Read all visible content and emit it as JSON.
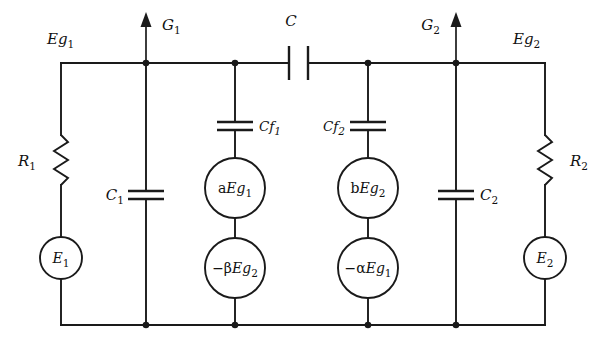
{
  "figure": {
    "name": "two-stage-coupled-amplifier-equivalent-circuit",
    "kind": "electrical-schematic",
    "background_color": "#ffffff",
    "line_color": "#1a1a1a",
    "width": 602,
    "height": 344
  },
  "labels": {
    "eg1": "Eg",
    "eg1_sub": "1",
    "eg2": "Eg",
    "eg2_sub": "2",
    "g1": "G",
    "g1_sub": "1",
    "g2": "G",
    "g2_sub": "2",
    "c_coupling": "C",
    "r1": "R",
    "r1_sub": "1",
    "r2": "R",
    "r2_sub": "2",
    "c1": "C",
    "c1_sub": "1",
    "c2": "C",
    "c2_sub": "2",
    "cf1": "Cf",
    "cf1_sub": "1",
    "cf2": "Cf",
    "cf2_sub": "2",
    "e1": "E",
    "e1_sub": "1",
    "e2": "E",
    "e2_sub": "2",
    "src_aeg1_prefix": "a",
    "src_aeg1_main": "Eg",
    "src_aeg1_sub": "1",
    "src_beg2_prefix": "b",
    "src_beg2_main": "Eg",
    "src_beg2_sub": "2",
    "src_mbeg2_prefix": "−β",
    "src_mbeg2_main": "Eg",
    "src_mbeg2_sub": "2",
    "src_maeg1_prefix": "−α",
    "src_maeg1_main": "Eg",
    "src_maeg1_sub": "1"
  },
  "components": [
    {
      "id": "R1",
      "type": "resistor",
      "label": "R1",
      "branch": "left-input",
      "between": [
        "top-rail-left-corner",
        "E1-top"
      ]
    },
    {
      "id": "E1",
      "type": "voltage-source",
      "label": "E1",
      "branch": "left-input",
      "between": [
        "R1-bottom",
        "bottom-rail"
      ]
    },
    {
      "id": "C1",
      "type": "capacitor",
      "label": "C1",
      "branch": "G1-node",
      "between": [
        "top-rail-node-G1",
        "bottom-rail"
      ]
    },
    {
      "id": "Cf1",
      "type": "capacitor",
      "label": "Cf1",
      "branch": "left-feedback",
      "between": [
        "top-rail-node-Cf1",
        "aEg1-top"
      ]
    },
    {
      "id": "aEg1",
      "type": "dependent-source",
      "label": "aEg1",
      "branch": "left-feedback",
      "between": [
        "Cf1-bottom",
        "-bEg2-top"
      ]
    },
    {
      "id": "-betaEg2",
      "type": "dependent-source",
      "label": "-βEg2",
      "branch": "left-feedback",
      "between": [
        "aEg1-bottom",
        "bottom-rail"
      ]
    },
    {
      "id": "C",
      "type": "capacitor",
      "label": "C",
      "branch": "top-rail-coupling",
      "between": [
        "top-rail-node-Cf1",
        "top-rail-node-Cf2"
      ]
    },
    {
      "id": "Cf2",
      "type": "capacitor",
      "label": "Cf2",
      "branch": "right-feedback",
      "between": [
        "top-rail-node-Cf2",
        "bEg2-top"
      ]
    },
    {
      "id": "bEg2",
      "type": "dependent-source",
      "label": "bEg2",
      "branch": "right-feedback",
      "between": [
        "Cf2-bottom",
        "-aEg1-top"
      ]
    },
    {
      "id": "-alphaEg1",
      "type": "dependent-source",
      "label": "-αEg1",
      "branch": "right-feedback",
      "between": [
        "bEg2-bottom",
        "bottom-rail"
      ]
    },
    {
      "id": "C2",
      "type": "capacitor",
      "label": "C2",
      "branch": "G2-node",
      "between": [
        "top-rail-node-G2",
        "bottom-rail"
      ]
    },
    {
      "id": "R2",
      "type": "resistor",
      "label": "R2",
      "branch": "right-output",
      "between": [
        "top-rail-right-corner",
        "E2-top"
      ]
    },
    {
      "id": "E2",
      "type": "voltage-source",
      "label": "E2",
      "branch": "right-output",
      "between": [
        "R2-bottom",
        "bottom-rail"
      ]
    }
  ],
  "nodes": [
    {
      "id": "G1",
      "label": "G1",
      "arrow": "up",
      "x": 146,
      "y": 63
    },
    {
      "id": "Cf1-tap",
      "x": 235,
      "y": 63
    },
    {
      "id": "Cf2-tap",
      "x": 368,
      "y": 63
    },
    {
      "id": "G2",
      "label": "G2",
      "arrow": "up",
      "x": 456,
      "y": 63
    }
  ]
}
